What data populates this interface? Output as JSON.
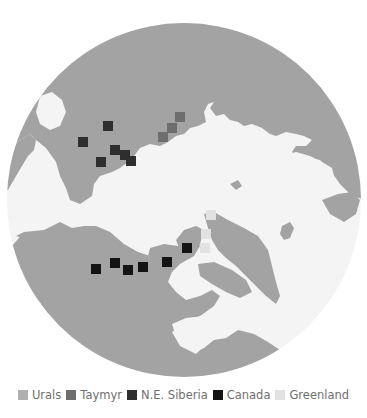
{
  "map": {
    "projection": "north-polar-azimuthal",
    "colors": {
      "land": "#a3a3a3",
      "water": "#f4f4f4",
      "background": "#ffffff"
    },
    "markers": [
      {
        "region": "N.E. Siberia",
        "x": 108,
        "y": 126
      },
      {
        "region": "N.E. Siberia",
        "x": 83,
        "y": 142
      },
      {
        "region": "N.E. Siberia",
        "x": 115,
        "y": 150
      },
      {
        "region": "N.E. Siberia",
        "x": 125,
        "y": 155
      },
      {
        "region": "N.E. Siberia",
        "x": 131,
        "y": 161
      },
      {
        "region": "N.E. Siberia",
        "x": 101,
        "y": 162
      },
      {
        "region": "Taymyr",
        "x": 180,
        "y": 117
      },
      {
        "region": "Taymyr",
        "x": 172,
        "y": 128
      },
      {
        "region": "Taymyr",
        "x": 163,
        "y": 137
      },
      {
        "region": "Canada",
        "x": 96,
        "y": 269
      },
      {
        "region": "Canada",
        "x": 115,
        "y": 263
      },
      {
        "region": "Canada",
        "x": 128,
        "y": 270
      },
      {
        "region": "Canada",
        "x": 143,
        "y": 267
      },
      {
        "region": "Canada",
        "x": 167,
        "y": 262
      },
      {
        "region": "Canada",
        "x": 187,
        "y": 248
      },
      {
        "region": "Greenland",
        "x": 211,
        "y": 215
      },
      {
        "region": "Greenland",
        "x": 206,
        "y": 234
      },
      {
        "region": "Greenland",
        "x": 205,
        "y": 248
      }
    ]
  },
  "legend": {
    "items": [
      {
        "label": "Urals",
        "color": "#b0b0b0"
      },
      {
        "label": "Taymyr",
        "color": "#6e6e6e"
      },
      {
        "label": "N.E. Siberia",
        "color": "#2e2e2e"
      },
      {
        "label": "Canada",
        "color": "#141414"
      },
      {
        "label": "Greenland",
        "color": "#e2e2e2"
      }
    ]
  }
}
